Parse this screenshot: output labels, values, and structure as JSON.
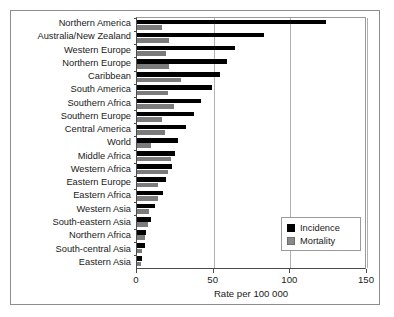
{
  "chart_data": {
    "type": "bar",
    "orientation": "horizontal",
    "title": "",
    "xlabel": "Rate per 100 000",
    "ylabel": "",
    "xlim": [
      0,
      150
    ],
    "xticks": [
      0,
      50,
      100,
      150
    ],
    "xticklabels": [
      "0",
      "50",
      "100",
      "150"
    ],
    "grid": true,
    "grid_axis": "x",
    "legend_position": "lower right",
    "categories": [
      "Northern America",
      "Australia/New Zealand",
      "Western Europe",
      "Northern Europe",
      "Caribbean",
      "South America",
      "Southern Africa",
      "Southern Europe",
      "Central America",
      "World",
      "Middle Africa",
      "Western Africa",
      "Eastern Europe",
      "Eastern Africa",
      "Western Asia",
      "South-eastern Asia",
      "Northern Africa",
      "South-central Asia",
      "Eastern Asia"
    ],
    "series": [
      {
        "name": "Incidence",
        "color": "#000000",
        "values": [
          123,
          83,
          64,
          59,
          54,
          49,
          42,
          37,
          32,
          27,
          25,
          23,
          19,
          17,
          12,
          9,
          6,
          5,
          3.5
        ]
      },
      {
        "name": "Mortality",
        "color": "#7b7b7b",
        "values": [
          16,
          21,
          19,
          21,
          29,
          20,
          24,
          16,
          18,
          9,
          22,
          20,
          14,
          14,
          8,
          7,
          5,
          3.5,
          2.5
        ]
      }
    ]
  },
  "legend": {
    "items": [
      {
        "label": "Incidence",
        "color": "#000000"
      },
      {
        "label": "Mortality",
        "color": "#8a8a8a"
      }
    ]
  }
}
